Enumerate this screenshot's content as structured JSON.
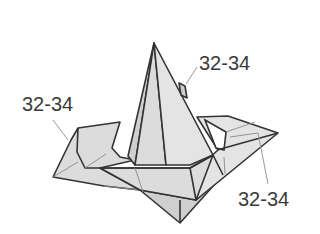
{
  "diagram": {
    "colors": {
      "paper": "#dcdcdc",
      "outline": "#333333",
      "crease": "#8a8a8a",
      "leader": "#9a9a9a",
      "label_text": "#3a3a3a",
      "background": "#ffffff"
    },
    "labels": [
      {
        "id": "top",
        "text": "32-34"
      },
      {
        "id": "left",
        "text": "32-34"
      },
      {
        "id": "right",
        "text": "32-34"
      }
    ]
  }
}
